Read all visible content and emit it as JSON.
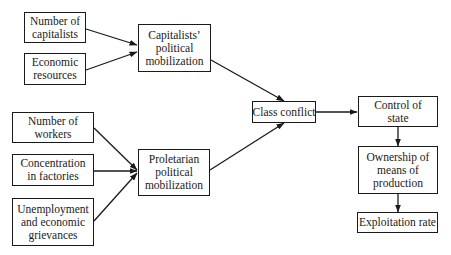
{
  "nodes": {
    "num_capitalists": {
      "label": "Number of capitalists"
    },
    "economic_resources": {
      "label": "Economic resources"
    },
    "capitalists_mobilization": {
      "label": "Capitalists’ political mobilization"
    },
    "num_workers": {
      "label": "Number of workers"
    },
    "concentration": {
      "label": "Concentration in factories"
    },
    "unemployment": {
      "label": "Unemployment and economic grievances"
    },
    "proletarian_mobilization": {
      "label": "Proletarian political mobilization"
    },
    "class_conflict": {
      "label": "Class conflict"
    },
    "control_state": {
      "label": "Control of state"
    },
    "ownership": {
      "label": "Ownership of means of production"
    },
    "exploitation": {
      "label": "Exploitation rate"
    }
  },
  "edges": [
    {
      "from": "num_capitalists",
      "to": "capitalists_mobilization"
    },
    {
      "from": "economic_resources",
      "to": "capitalists_mobilization"
    },
    {
      "from": "num_workers",
      "to": "proletarian_mobilization"
    },
    {
      "from": "concentration",
      "to": "proletarian_mobilization"
    },
    {
      "from": "unemployment",
      "to": "proletarian_mobilization"
    },
    {
      "from": "capitalists_mobilization",
      "to": "class_conflict"
    },
    {
      "from": "proletarian_mobilization",
      "to": "class_conflict"
    },
    {
      "from": "class_conflict",
      "to": "control_state"
    },
    {
      "from": "control_state",
      "to": "ownership"
    },
    {
      "from": "ownership",
      "to": "exploitation"
    }
  ]
}
